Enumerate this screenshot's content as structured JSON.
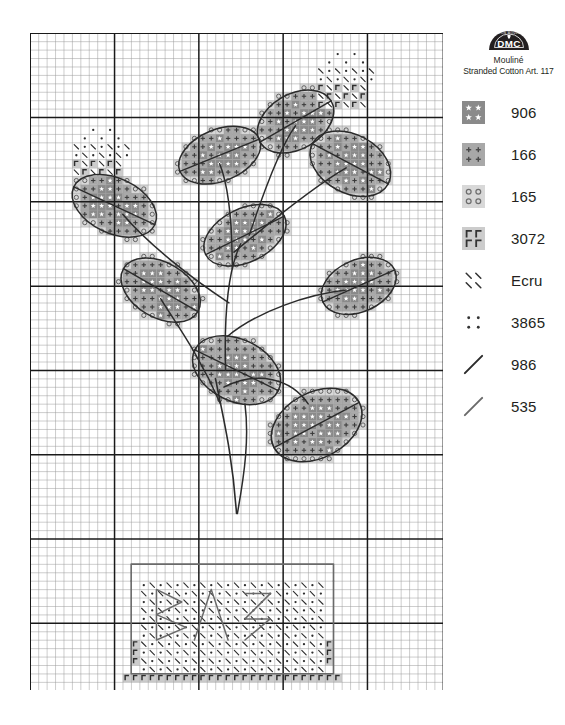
{
  "brand": {
    "logo_text": "DMC",
    "logo_ring_text": "COTON MOULINE",
    "line1": "Mouliné",
    "line2": "Stranded Cotton Art. 117"
  },
  "legend": {
    "entries": [
      {
        "code": "906",
        "symbol": "star",
        "cell_color": "#8a8a8a",
        "glyph_color": "#ffffff",
        "kind": "fill"
      },
      {
        "code": "166",
        "symbol": "cross",
        "cell_color": "#a8a8a8",
        "glyph_color": "#4a4a4a",
        "kind": "fill"
      },
      {
        "code": "165",
        "symbol": "circle",
        "cell_color": "#d8d8d8",
        "glyph_color": "#6e6e6e",
        "kind": "fill"
      },
      {
        "code": "3072",
        "symbol": "r",
        "cell_color": "#cccccc",
        "glyph_color": "#333333",
        "kind": "fill"
      },
      {
        "code": "Ecru",
        "symbol": "backslash",
        "cell_color": "#ffffff",
        "glyph_color": "#333333",
        "kind": "fill"
      },
      {
        "code": "3865",
        "symbol": "dot",
        "cell_color": "#ffffff",
        "glyph_color": "#333333",
        "kind": "fill"
      },
      {
        "code": "986",
        "symbol": "line",
        "cell_color": "#ffffff",
        "glyph_color": "#2b2b2b",
        "kind": "backstitch"
      },
      {
        "code": "535",
        "symbol": "line",
        "cell_color": "#ffffff",
        "glyph_color": "#6a6a6a",
        "kind": "backstitch"
      }
    ]
  },
  "chart_data": {
    "type": "grid-pattern",
    "grid": {
      "columns": 49,
      "rows": 78,
      "cell_px": 8.43,
      "minor_line_color": "#9a9a9a",
      "major_line_color": "#1a1a1a",
      "major_every": 10,
      "background": "#ffffff"
    },
    "palette": {
      "906": "#8a8a8a",
      "166": "#a8a8a8",
      "165": "#d8d8d8",
      "3072": "#cccccc",
      "Ecru": "#ffffff",
      "3865": "#ffffff",
      "986": "#2b2b2b",
      "535": "#6a6a6a"
    },
    "leaves": [
      {
        "name": "leaf-top-right",
        "cx": 31.5,
        "cy": 10.5,
        "rx": 4.6,
        "ry": 3.2,
        "rot": -30
      },
      {
        "name": "leaf-upper-mid",
        "cx": 22.5,
        "cy": 14.5,
        "rx": 4.8,
        "ry": 3.0,
        "rot": -22
      },
      {
        "name": "leaf-upper-right",
        "cx": 38.0,
        "cy": 15.5,
        "rx": 4.8,
        "ry": 3.4,
        "rot": 28
      },
      {
        "name": "leaf-left-upper",
        "cx": 10.0,
        "cy": 20.5,
        "rx": 5.0,
        "ry": 3.2,
        "rot": 25
      },
      {
        "name": "leaf-center",
        "cx": 25.5,
        "cy": 24.0,
        "rx": 4.9,
        "ry": 3.1,
        "rot": -26
      },
      {
        "name": "leaf-left-mid",
        "cx": 15.5,
        "cy": 30.5,
        "rx": 4.8,
        "ry": 3.2,
        "rot": 30
      },
      {
        "name": "leaf-right-mid",
        "cx": 39.0,
        "cy": 30.0,
        "rx": 4.4,
        "ry": 3.0,
        "rot": -24
      },
      {
        "name": "leaf-center-low",
        "cx": 24.5,
        "cy": 40.0,
        "rx": 5.2,
        "ry": 3.6,
        "rot": 26
      },
      {
        "name": "leaf-bottom-right",
        "cx": 34.0,
        "cy": 46.5,
        "rx": 5.4,
        "ry": 3.8,
        "rot": -28
      }
    ],
    "top_motif": {
      "name": "flower-bud-top",
      "col": 34,
      "row": 2,
      "w": 7,
      "h": 7
    },
    "left_motif": {
      "name": "flower-bud-left",
      "col": 5,
      "row": 11,
      "w": 7,
      "h": 6
    },
    "pot": {
      "name": "plant-pot",
      "rim_col": 12,
      "rim_row": 63,
      "rim_w": 24,
      "rim_h": 2,
      "body_col": 13,
      "body_row": 65,
      "body_w": 22,
      "body_h": 11,
      "base_row": 76,
      "outline_color": "535",
      "fill_symbols": [
        "3865",
        "Ecru"
      ],
      "base_symbol": "3072"
    },
    "stems_color": "986",
    "pot_outline_color": "535"
  }
}
